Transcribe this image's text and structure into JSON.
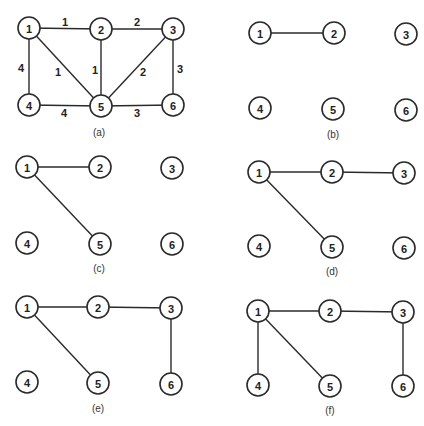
{
  "figure": {
    "node_labels": [
      "1",
      "2",
      "3",
      "4",
      "5",
      "6"
    ],
    "colors": {
      "stroke": "#2a2a2a",
      "background": "#ffffff",
      "text": "#222222"
    },
    "panels": [
      {
        "id": "a",
        "caption": "(a)",
        "caption_pos": [
          99,
          132
        ],
        "nodes": {
          "1": [
            29,
            28
          ],
          "2": [
            101,
            29
          ],
          "3": [
            173,
            29
          ],
          "4": [
            29,
            105
          ],
          "5": [
            101,
            106
          ],
          "6": [
            173,
            105
          ]
        },
        "edges": [
          {
            "from": "1",
            "to": "2",
            "weight": "1",
            "label_pos": [
              65,
              22
            ]
          },
          {
            "from": "2",
            "to": "3",
            "weight": "2",
            "label_pos": [
              137,
              22
            ]
          },
          {
            "from": "1",
            "to": "4",
            "weight": "4",
            "label_pos": [
              21,
              68
            ]
          },
          {
            "from": "1",
            "to": "5",
            "weight": "1",
            "label_pos": [
              58,
              72
            ]
          },
          {
            "from": "2",
            "to": "5",
            "weight": "1",
            "label_pos": [
              95,
              70
            ]
          },
          {
            "from": "3",
            "to": "5",
            "weight": "2",
            "label_pos": [
              143,
              72
            ]
          },
          {
            "from": "3",
            "to": "6",
            "weight": "3",
            "label_pos": [
              180,
              69
            ]
          },
          {
            "from": "4",
            "to": "5",
            "weight": "4",
            "label_pos": [
              64,
              113
            ]
          },
          {
            "from": "5",
            "to": "6",
            "weight": "3",
            "label_pos": [
              137,
              113
            ]
          }
        ]
      },
      {
        "id": "b",
        "caption": "(b)",
        "caption_pos": [
          333,
          134
        ],
        "nodes": {
          "1": [
            260,
            33
          ],
          "2": [
            334,
            33
          ],
          "3": [
            406,
            34
          ],
          "4": [
            260,
            108
          ],
          "5": [
            333,
            109
          ],
          "6": [
            406,
            110
          ]
        },
        "edges": [
          {
            "from": "1",
            "to": "2"
          }
        ]
      },
      {
        "id": "c",
        "caption": "(c)",
        "caption_pos": [
          99,
          268
        ],
        "nodes": {
          "1": [
            27,
            167
          ],
          "2": [
            100,
            167
          ],
          "3": [
            172,
            168
          ],
          "4": [
            27,
            243
          ],
          "5": [
            100,
            244
          ],
          "6": [
            172,
            244
          ]
        },
        "edges": [
          {
            "from": "1",
            "to": "2"
          },
          {
            "from": "1",
            "to": "5"
          }
        ]
      },
      {
        "id": "d",
        "caption": "(d)",
        "caption_pos": [
          332,
          271
        ],
        "nodes": {
          "1": [
            259,
            172
          ],
          "2": [
            332,
            172
          ],
          "3": [
            404,
            173
          ],
          "4": [
            259,
            246
          ],
          "5": [
            332,
            247
          ],
          "6": [
            404,
            248
          ]
        },
        "edges": [
          {
            "from": "1",
            "to": "2"
          },
          {
            "from": "2",
            "to": "3"
          },
          {
            "from": "1",
            "to": "5"
          }
        ]
      },
      {
        "id": "e",
        "caption": "(e)",
        "caption_pos": [
          98,
          408
        ],
        "nodes": {
          "1": [
            27,
            307
          ],
          "2": [
            98,
            307
          ],
          "3": [
            171,
            308
          ],
          "4": [
            27,
            382
          ],
          "5": [
            98,
            383
          ],
          "6": [
            171,
            384
          ]
        },
        "edges": [
          {
            "from": "1",
            "to": "2"
          },
          {
            "from": "2",
            "to": "3"
          },
          {
            "from": "1",
            "to": "5"
          },
          {
            "from": "3",
            "to": "6"
          }
        ]
      },
      {
        "id": "f",
        "caption": "(f)",
        "caption_pos": [
          330,
          410
        ],
        "nodes": {
          "1": [
            258,
            311
          ],
          "2": [
            330,
            311
          ],
          "3": [
            403,
            312
          ],
          "4": [
            258,
            385
          ],
          "5": [
            330,
            386
          ],
          "6": [
            403,
            386
          ]
        },
        "edges": [
          {
            "from": "1",
            "to": "2"
          },
          {
            "from": "2",
            "to": "3"
          },
          {
            "from": "1",
            "to": "5"
          },
          {
            "from": "3",
            "to": "6"
          },
          {
            "from": "1",
            "to": "4"
          }
        ]
      }
    ]
  }
}
